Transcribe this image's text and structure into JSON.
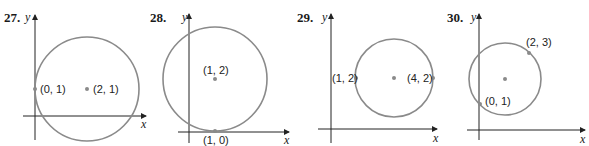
{
  "colors": {
    "axis": "#222222",
    "circle": "#8a8a8a",
    "point": "#8a8a8a",
    "text": "#1a1a1a"
  },
  "problems": [
    {
      "number": "27.",
      "y_label": "y",
      "x_label": "x",
      "points": [
        {
          "label": "(0, 1)"
        },
        {
          "label": "(2, 1)"
        }
      ]
    },
    {
      "number": "28.",
      "y_label": "y",
      "x_label": "x",
      "points": [
        {
          "label": "(1, 2)"
        },
        {
          "label": "(1, 0)"
        }
      ]
    },
    {
      "number": "29.",
      "y_label": "y",
      "x_label": "x",
      "points": [
        {
          "label": "(1, 2)"
        },
        {
          "label": "(4, 2)"
        }
      ]
    },
    {
      "number": "30.",
      "y_label": "y",
      "x_label": "x",
      "points": [
        {
          "label": "(2, 3)"
        },
        {
          "label": "(0, 1)"
        }
      ]
    }
  ]
}
